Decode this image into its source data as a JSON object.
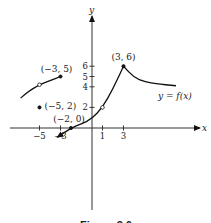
{
  "chart_data": {
    "type": "line",
    "title": "",
    "caption": "Figure 2.6",
    "xlabel": "x",
    "ylabel": "y",
    "function_label": "y = f(x)",
    "xlim": [
      -8,
      10
    ],
    "ylim": [
      -10,
      8
    ],
    "x_ticks": [
      -5,
      -3,
      1,
      3
    ],
    "x_tick_labels": [
      "−5",
      "−3",
      "1",
      "3"
    ],
    "y_ticks": [
      2,
      4,
      5,
      6
    ],
    "y_tick_labels": [
      "2",
      "4",
      "5",
      "6"
    ],
    "grid": false,
    "segments": [
      {
        "name": "left-branch",
        "points": [
          [
            -6.8,
            2.9
          ],
          [
            -6,
            3.6
          ],
          [
            -5,
            4.2
          ],
          [
            -4,
            4.6
          ],
          [
            -3,
            5
          ]
        ],
        "left_end": "plain",
        "right_end": "closed"
      },
      {
        "name": "middle-branch",
        "points": [
          [
            -3.3,
            -0.9
          ],
          [
            -2,
            0
          ],
          [
            -1,
            0.4
          ],
          [
            0,
            0.9
          ],
          [
            1,
            2
          ],
          [
            2,
            3.8
          ],
          [
            3,
            6
          ]
        ],
        "left_end": "arrow",
        "right_end": "closed"
      },
      {
        "name": "right-branch",
        "points": [
          [
            3,
            6
          ],
          [
            4,
            4.9
          ],
          [
            5,
            4.5
          ],
          [
            6,
            4.3
          ],
          [
            8,
            4.1
          ]
        ],
        "left_end": "none",
        "right_end": "plain"
      }
    ],
    "points": [
      {
        "x": -5,
        "y": 2,
        "label": "(−5, 2)",
        "style": "closed"
      },
      {
        "x": -3,
        "y": 5,
        "label": "(−3, 5)",
        "style": "closed"
      },
      {
        "x": -5,
        "y": 4.2,
        "label": "",
        "style": "open"
      },
      {
        "x": -2,
        "y": 0,
        "label": "(−2, 0)",
        "style": "closed"
      },
      {
        "x": 1,
        "y": 2,
        "label": "",
        "style": "open"
      },
      {
        "x": 3,
        "y": 6,
        "label": "(3, 6)",
        "style": "closed"
      }
    ]
  }
}
